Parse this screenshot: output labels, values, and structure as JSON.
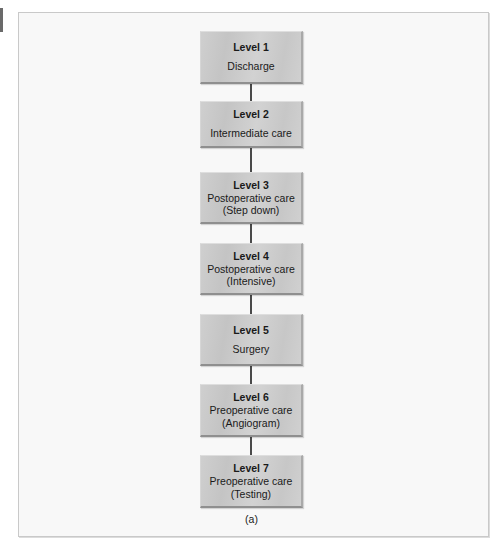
{
  "figure": {
    "caption": "(a)",
    "levels": [
      {
        "title": "Level 1",
        "lines": [
          "Discharge"
        ]
      },
      {
        "title": "Level 2",
        "lines": [
          "Intermediate care"
        ]
      },
      {
        "title": "Level 3",
        "lines": [
          "Postoperative care",
          "(Step down)"
        ]
      },
      {
        "title": "Level 4",
        "lines": [
          "Postoperative care",
          "(Intensive)"
        ]
      },
      {
        "title": "Level 5",
        "lines": [
          "Surgery"
        ]
      },
      {
        "title": "Level 6",
        "lines": [
          "Preoperative care",
          "(Angiogram)"
        ]
      },
      {
        "title": "Level 7",
        "lines": [
          "Preoperative care",
          "(Testing)"
        ]
      }
    ]
  },
  "colors": {
    "box_fill": "#c9c9c9",
    "connector": "#4a4a4a",
    "frame_border": "#c9c9c9",
    "background": "#f8f8f8"
  }
}
